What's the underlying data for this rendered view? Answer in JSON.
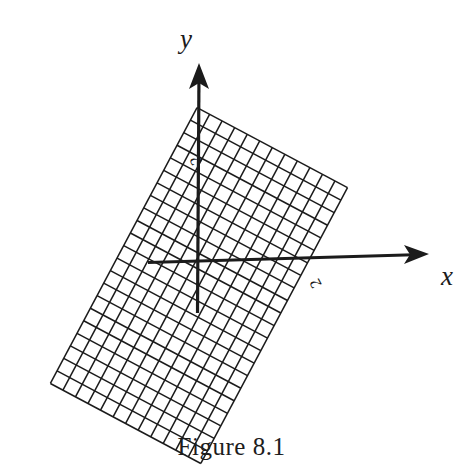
{
  "figure": {
    "caption": "Figure 8.1",
    "background_color": "#ffffff",
    "ink_color": "#1b1b1b"
  },
  "axes": {
    "x_label": "x",
    "y_label": "y",
    "x_arrow_direction": "right",
    "y_arrow_direction": "up",
    "origin": {
      "x": 197,
      "y": 262
    },
    "x_axis_start": {
      "x": 148,
      "y": 262
    },
    "x_axis_end": {
      "x": 430,
      "y": 254
    },
    "y_axis_start": {
      "x": 197,
      "y": 313
    },
    "y_axis_end": {
      "x": 199,
      "y": 63
    }
  },
  "tick_labels": [
    {
      "name": "y-axis-tick-2",
      "text": "2",
      "x": 200,
      "y": 158,
      "rotation": -118
    },
    {
      "name": "x-axis-tick-2",
      "text": "2",
      "x": 320,
      "y": 281,
      "rotation": -118
    }
  ],
  "chart_data": {
    "type": "scatter",
    "title": "Figure 8.1",
    "xlabel": "x",
    "ylabel": "y",
    "grid": {
      "rotation_degrees": -28,
      "cell_size_px": 14.2,
      "columns": 12,
      "rows": 22,
      "origin_offset": {
        "u": 5.1,
        "v": 9.6
      },
      "corners": [
        {
          "name": "top",
          "x": 121,
          "y": 95
        },
        {
          "name": "left",
          "x": 28,
          "y": 212
        },
        {
          "name": "bottom",
          "x": 296,
          "y": 426
        },
        {
          "name": "right",
          "x": 389,
          "y": 309
        }
      ]
    },
    "axis_ticks": {
      "x": [
        2
      ],
      "y": [
        2
      ]
    },
    "legend": [],
    "grid_on": true
  }
}
